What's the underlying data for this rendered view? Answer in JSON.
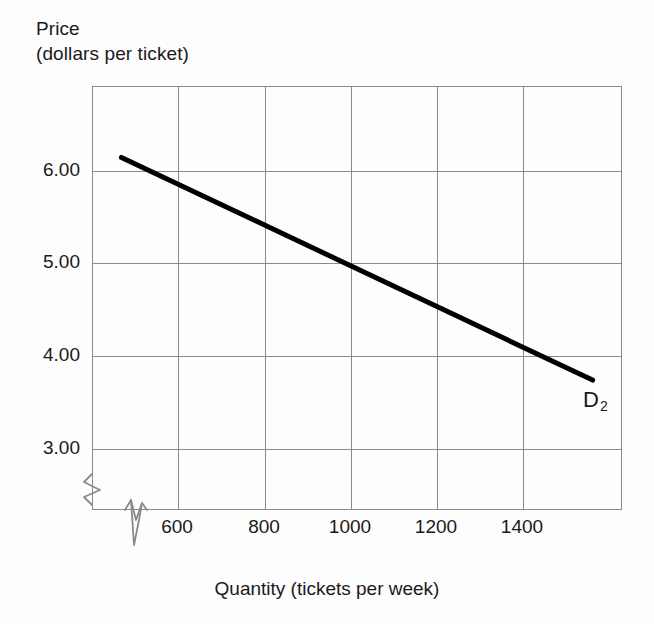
{
  "chart_data": {
    "type": "line",
    "title": "",
    "ylabel_line1": "Price",
    "ylabel_line2": "(dollars per ticket)",
    "xlabel": "Quantity (tickets per week)",
    "xtick_labels": [
      "600",
      "800",
      "1000",
      "1200",
      "1400"
    ],
    "xticks": [
      600,
      800,
      1000,
      1200,
      1400
    ],
    "ytick_labels": [
      "6.00",
      "5.00",
      "4.00",
      "3.00"
    ],
    "yticks": [
      6.0,
      5.0,
      4.0,
      3.0
    ],
    "xlim": [
      480,
      1560
    ],
    "ylim": [
      2.35,
      6.92
    ],
    "grid": true,
    "legend_position": "inline-right",
    "axis_break_x": true,
    "axis_break_y": true,
    "series": [
      {
        "name": "D2",
        "label": "D",
        "label_subscript": "2",
        "color": "#000000",
        "linewidth": 5,
        "x": [
          540,
          1500
        ],
        "values": [
          6.15,
          3.75
        ],
        "points": [
          {
            "x": 540,
            "y": 6.15
          },
          {
            "x": 600,
            "y": 6.0
          },
          {
            "x": 800,
            "y": 5.5
          },
          {
            "x": 1000,
            "y": 5.0
          },
          {
            "x": 1200,
            "y": 4.5
          },
          {
            "x": 1400,
            "y": 4.0
          },
          {
            "x": 1500,
            "y": 3.75
          }
        ]
      }
    ],
    "colors": {
      "background": "#fdfdfd",
      "grid": "#8a8a8a",
      "axis": "#8a8a8a",
      "text": "#1a1a1a",
      "curve": "#000000"
    }
  }
}
